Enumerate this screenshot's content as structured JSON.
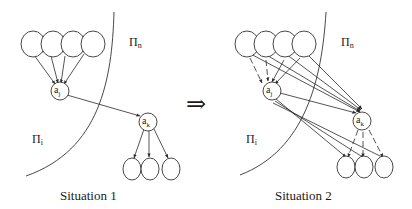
{
  "diagram": {
    "implies_symbol": "⇒",
    "situation1": {
      "caption": "Situation 1",
      "region_outer": "Π",
      "region_outer_sub": "n",
      "region_inner": "Π",
      "region_inner_sub": "i",
      "node_j": "a",
      "node_j_sub": "j",
      "node_k": "a",
      "node_k_sub": "k",
      "parents_of_j": 4,
      "children_of_k": 3
    },
    "situation2": {
      "caption": "Situation 2",
      "region_outer": "Π",
      "region_outer_sub": "n",
      "region_inner": "Π",
      "region_inner_sub": "i",
      "node_j": "a",
      "node_j_sub": "j",
      "node_k": "a",
      "node_k_sub": "k",
      "parents_count": 4,
      "children_count": 3
    },
    "colors": {
      "stroke": "#333333",
      "background": "#ffffff"
    }
  }
}
